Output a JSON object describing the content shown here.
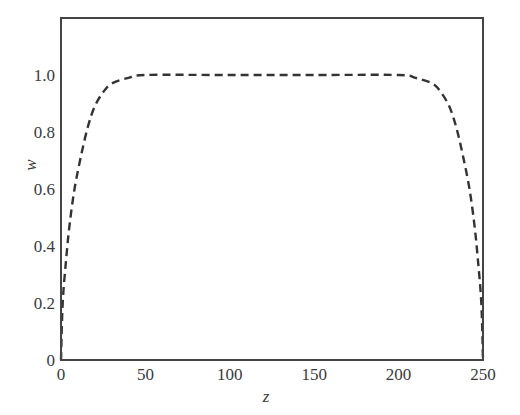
{
  "chart_data": {
    "type": "line",
    "title": "",
    "xlabel": "z",
    "ylabel": "w",
    "xlim": [
      0,
      250
    ],
    "ylim": [
      0,
      1.2
    ],
    "grid": false,
    "legend": null,
    "x_ticks": [
      0,
      50,
      100,
      150,
      200,
      250
    ],
    "x_tick_labels": [
      "0",
      "50",
      "100",
      "150",
      "200",
      "250"
    ],
    "y_ticks": [
      0,
      0.2,
      0.4,
      0.6,
      0.8,
      1.0
    ],
    "y_tick_labels": [
      "0",
      "0.2",
      "0.4",
      "0.6",
      "0.8",
      "1.0"
    ],
    "series": [
      {
        "name": "w(z)",
        "style": "dashed",
        "color": "#333333",
        "x": [
          0,
          1,
          3,
          5,
          8,
          12,
          16,
          20,
          25,
          30,
          40,
          50,
          100,
          150,
          200,
          210,
          220,
          225,
          230,
          234,
          238,
          242,
          245,
          247,
          249,
          250
        ],
        "y": [
          0,
          0.2,
          0.35,
          0.47,
          0.6,
          0.72,
          0.82,
          0.89,
          0.94,
          0.97,
          0.99,
          1.0,
          1.0,
          1.0,
          1.0,
          0.99,
          0.97,
          0.94,
          0.89,
          0.82,
          0.72,
          0.6,
          0.47,
          0.35,
          0.2,
          0
        ]
      }
    ]
  }
}
